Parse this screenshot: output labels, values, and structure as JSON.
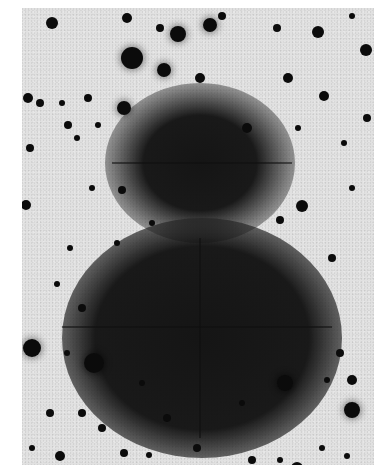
{
  "image": {
    "description": "Inverted (negative) grayscale astronomical plate showing two overlapping diffuse dark nebulous regions with diffraction spikes, surrounded by a field of dark star points on a light gray background",
    "colors": {
      "background": "#dcdcdc",
      "star": "#111111",
      "nebula_core": "#1a1a1a",
      "page": "#ffffff"
    },
    "nebulae": [
      {
        "name": "upper-glow",
        "cx": 178,
        "cy": 155,
        "rx": 95,
        "ry": 80,
        "core_r": 40
      },
      {
        "name": "lower-glow",
        "cx": 180,
        "cy": 330,
        "rx": 140,
        "ry": 120,
        "core_r": 75
      }
    ],
    "spikes": [
      {
        "x": 90,
        "y": 154,
        "w": 180,
        "h": 2
      },
      {
        "x": 40,
        "y": 318,
        "w": 270,
        "h": 2
      },
      {
        "x": 177,
        "y": 230,
        "w": 2,
        "h": 200
      }
    ],
    "stars": [
      {
        "x": 30,
        "y": 15,
        "r": 6
      },
      {
        "x": 105,
        "y": 10,
        "r": 5
      },
      {
        "x": 156,
        "y": 26,
        "r": 8
      },
      {
        "x": 188,
        "y": 17,
        "r": 7
      },
      {
        "x": 200,
        "y": 8,
        "r": 4
      },
      {
        "x": 110,
        "y": 50,
        "r": 11
      },
      {
        "x": 142,
        "y": 62,
        "r": 7
      },
      {
        "x": 138,
        "y": 20,
        "r": 4
      },
      {
        "x": 255,
        "y": 20,
        "r": 4
      },
      {
        "x": 296,
        "y": 24,
        "r": 6
      },
      {
        "x": 344,
        "y": 42,
        "r": 6
      },
      {
        "x": 330,
        "y": 8,
        "r": 3
      },
      {
        "x": 178,
        "y": 70,
        "r": 5
      },
      {
        "x": 266,
        "y": 70,
        "r": 5
      },
      {
        "x": 302,
        "y": 88,
        "r": 5
      },
      {
        "x": 6,
        "y": 90,
        "r": 5
      },
      {
        "x": 18,
        "y": 95,
        "r": 4
      },
      {
        "x": 66,
        "y": 90,
        "r": 4
      },
      {
        "x": 102,
        "y": 100,
        "r": 7
      },
      {
        "x": 40,
        "y": 95,
        "r": 3
      },
      {
        "x": 46,
        "y": 117,
        "r": 4
      },
      {
        "x": 76,
        "y": 117,
        "r": 3
      },
      {
        "x": 8,
        "y": 140,
        "r": 4
      },
      {
        "x": 55,
        "y": 130,
        "r": 3
      },
      {
        "x": 225,
        "y": 120,
        "r": 5
      },
      {
        "x": 276,
        "y": 120,
        "r": 3
      },
      {
        "x": 322,
        "y": 135,
        "r": 3
      },
      {
        "x": 345,
        "y": 110,
        "r": 4
      },
      {
        "x": 4,
        "y": 197,
        "r": 5
      },
      {
        "x": 70,
        "y": 180,
        "r": 3
      },
      {
        "x": 100,
        "y": 182,
        "r": 4
      },
      {
        "x": 280,
        "y": 198,
        "r": 6
      },
      {
        "x": 258,
        "y": 212,
        "r": 4
      },
      {
        "x": 330,
        "y": 180,
        "r": 3
      },
      {
        "x": 48,
        "y": 240,
        "r": 3
      },
      {
        "x": 95,
        "y": 235,
        "r": 3
      },
      {
        "x": 130,
        "y": 215,
        "r": 3
      },
      {
        "x": 310,
        "y": 250,
        "r": 4
      },
      {
        "x": 35,
        "y": 276,
        "r": 3
      },
      {
        "x": 60,
        "y": 300,
        "r": 4
      },
      {
        "x": 10,
        "y": 340,
        "r": 9
      },
      {
        "x": 72,
        "y": 355,
        "r": 10
      },
      {
        "x": 45,
        "y": 345,
        "r": 3
      },
      {
        "x": 318,
        "y": 345,
        "r": 4
      },
      {
        "x": 263,
        "y": 375,
        "r": 8
      },
      {
        "x": 330,
        "y": 372,
        "r": 5
      },
      {
        "x": 330,
        "y": 402,
        "r": 8
      },
      {
        "x": 305,
        "y": 372,
        "r": 3
      },
      {
        "x": 28,
        "y": 405,
        "r": 4
      },
      {
        "x": 60,
        "y": 405,
        "r": 4
      },
      {
        "x": 80,
        "y": 420,
        "r": 4
      },
      {
        "x": 102,
        "y": 445,
        "r": 4
      },
      {
        "x": 38,
        "y": 448,
        "r": 5
      },
      {
        "x": 145,
        "y": 410,
        "r": 4
      },
      {
        "x": 127,
        "y": 447,
        "r": 3
      },
      {
        "x": 175,
        "y": 440,
        "r": 4
      },
      {
        "x": 230,
        "y": 452,
        "r": 4
      },
      {
        "x": 258,
        "y": 452,
        "r": 3
      },
      {
        "x": 275,
        "y": 460,
        "r": 6
      },
      {
        "x": 300,
        "y": 440,
        "r": 3
      },
      {
        "x": 325,
        "y": 448,
        "r": 3
      },
      {
        "x": 10,
        "y": 440,
        "r": 3
      },
      {
        "x": 120,
        "y": 375,
        "r": 3
      },
      {
        "x": 220,
        "y": 395,
        "r": 3
      },
      {
        "x": 160,
        "y": 465,
        "r": 3
      }
    ]
  }
}
